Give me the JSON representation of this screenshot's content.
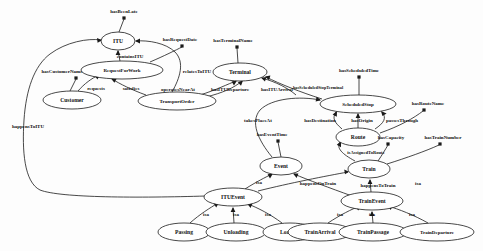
{
  "diagram": {
    "type": "ontology-graph",
    "background_color": "#fdfdfd",
    "stroke_color": "#1a1a1a",
    "text_color": "#101010",
    "entities": [
      {
        "id": "itu",
        "label": "ITU",
        "cx": 118,
        "cy": 41,
        "rx": 17,
        "ry": 9
      },
      {
        "id": "requestforwork",
        "label": "RequestForWork",
        "cx": 122,
        "cy": 70,
        "rx": 41,
        "ry": 9
      },
      {
        "id": "terminal",
        "label": "Terminal",
        "cx": 240,
        "cy": 72,
        "rx": 27,
        "ry": 9
      },
      {
        "id": "customer",
        "label": "Customer",
        "cx": 72,
        "cy": 100,
        "rx": 29,
        "ry": 9
      },
      {
        "id": "transportorder",
        "label": "TransportOrder",
        "cx": 177,
        "cy": 101,
        "rx": 39,
        "ry": 9
      },
      {
        "id": "scheduledstop",
        "label": "ScheduledStop",
        "cx": 358,
        "cy": 104,
        "rx": 38,
        "ry": 9
      },
      {
        "id": "route",
        "label": "Route",
        "cx": 358,
        "cy": 137,
        "rx": 22,
        "ry": 9
      },
      {
        "id": "event",
        "label": "Event",
        "cx": 281,
        "cy": 166,
        "rx": 21,
        "ry": 9
      },
      {
        "id": "train",
        "label": "Train",
        "cx": 369,
        "cy": 169,
        "rx": 21,
        "ry": 9
      },
      {
        "id": "ituevent",
        "label": "ITUEvent",
        "cx": 233,
        "cy": 197,
        "rx": 29,
        "ry": 9
      },
      {
        "id": "trainevent",
        "label": "TrainEvent",
        "cx": 372,
        "cy": 201,
        "rx": 31,
        "ry": 9
      },
      {
        "id": "passing",
        "label": "Passing",
        "cx": 184,
        "cy": 232,
        "rx": 26,
        "ry": 9
      },
      {
        "id": "unloading",
        "label": "Unloading",
        "cx": 236,
        "cy": 232,
        "rx": 30,
        "ry": 9
      },
      {
        "id": "loading",
        "label": "Loading",
        "cx": 290,
        "cy": 232,
        "rx": 27,
        "ry": 9
      },
      {
        "id": "trainarrival",
        "label": "TrainArrival",
        "cx": 320,
        "cy": 232,
        "rx": 32,
        "ry": 9
      },
      {
        "id": "trainpassage",
        "label": "TrainPassage",
        "cx": 373,
        "cy": 232,
        "rx": 34,
        "ry": 9
      },
      {
        "id": "traindeparture",
        "label": "TrainDeparture",
        "cx": 437,
        "cy": 232,
        "rx": 37,
        "ry": 9
      }
    ],
    "relations": [
      {
        "id": "rel-hasbeenlate",
        "label": "hasBeenLate",
        "lx": 124,
        "ly": 11
      },
      {
        "id": "rel-hasrequestdate",
        "label": "hasRequestDate",
        "lx": 180,
        "ly": 39
      },
      {
        "id": "rel-hasterminalname",
        "label": "hasTerminalName",
        "lx": 233,
        "ly": 40
      },
      {
        "id": "rel-containsitu",
        "label": "containsITU",
        "lx": 130,
        "ly": 56
      },
      {
        "id": "rel-relatestoitu",
        "label": "relatesToITU",
        "lx": 197,
        "ly": 71
      },
      {
        "id": "rel-hascustomername",
        "label": "hasCustomerName",
        "lx": 62,
        "ly": 71
      },
      {
        "id": "rel-hasscheduledtime",
        "label": "hasScheduledTime",
        "lx": 359,
        "ly": 70
      },
      {
        "id": "rel-hasscheduledstopterminal",
        "label": "hasScheduledStopTerminal",
        "lx": 318,
        "ly": 87
      },
      {
        "id": "rel-requests",
        "label": "requests",
        "lx": 96,
        "ly": 88
      },
      {
        "id": "rel-satisfies",
        "label": "satisfies",
        "lx": 131,
        "ly": 88
      },
      {
        "id": "rel-operatesnearat",
        "label": "operatesNearAt",
        "lx": 178,
        "ly": 89
      },
      {
        "id": "rel-hasitudeparture",
        "label": "hasITUDeparture",
        "lx": 230,
        "ly": 89
      },
      {
        "id": "rel-hasituarrival",
        "label": "hasITUArrival",
        "lx": 277,
        "ly": 89
      },
      {
        "id": "rel-hasroutename",
        "label": "hasRouteName",
        "lx": 428,
        "ly": 103
      },
      {
        "id": "rel-takesplaceat",
        "label": "takesPlaceAt",
        "lx": 258,
        "ly": 120
      },
      {
        "id": "rel-hasdestination",
        "label": "hasDestination",
        "lx": 320,
        "ly": 120
      },
      {
        "id": "rel-hasorigin",
        "label": "hasOrigin",
        "lx": 362,
        "ly": 120
      },
      {
        "id": "rel-passesthrough",
        "label": "passesThrough",
        "lx": 402,
        "ly": 120
      },
      {
        "id": "rel-haseventtime",
        "label": "hasEventTime",
        "lx": 272,
        "ly": 134
      },
      {
        "id": "rel-hascapacity",
        "label": "hasCapacity",
        "lx": 391,
        "ly": 137
      },
      {
        "id": "rel-hastrainnumber",
        "label": "hasTrainNumber",
        "lx": 443,
        "ly": 137
      },
      {
        "id": "rel-isassignedtoroute",
        "label": "isAssignedToRoute",
        "lx": 366,
        "ly": 152
      },
      {
        "id": "rel-happenstoitu",
        "label": "happensToITU",
        "lx": 28,
        "ly": 126
      },
      {
        "id": "rel-isa-event-ituevent",
        "label": "isa",
        "lx": 259,
        "ly": 182
      },
      {
        "id": "rel-happensontrain",
        "label": "happensOnTrain",
        "lx": 318,
        "ly": 183
      },
      {
        "id": "rel-isa-train-trainevent",
        "label": "isa",
        "lx": 418,
        "ly": 183
      },
      {
        "id": "rel-happenstotrain",
        "label": "happensToTrain",
        "lx": 378,
        "ly": 185
      },
      {
        "id": "rel-isa-passing",
        "label": "isa",
        "lx": 206,
        "ly": 214
      },
      {
        "id": "rel-isa-unloading",
        "label": "isa",
        "lx": 236,
        "ly": 214
      },
      {
        "id": "rel-isa-loading",
        "label": "isa",
        "lx": 268,
        "ly": 214
      },
      {
        "id": "rel-isa-trainarrival",
        "label": "isa",
        "lx": 340,
        "ly": 214
      },
      {
        "id": "rel-isa-trainpassage",
        "label": "isa",
        "lx": 372,
        "ly": 214
      },
      {
        "id": "rel-isa-traindeparture",
        "label": "isa",
        "lx": 412,
        "ly": 214
      }
    ],
    "attribute_markers": [
      {
        "id": "dot-hasbeenlate",
        "cx": 124,
        "cy": 18
      },
      {
        "id": "dot-hasrequestdate",
        "cx": 182,
        "cy": 46
      },
      {
        "id": "dot-hasterminalname",
        "cx": 237,
        "cy": 47
      },
      {
        "id": "dot-hascustomername",
        "cx": 76,
        "cy": 78
      },
      {
        "id": "dot-hasscheduledtime",
        "cx": 359,
        "cy": 77
      },
      {
        "id": "dot-hasroutename",
        "cx": 424,
        "cy": 110
      },
      {
        "id": "dot-haseventtime",
        "cx": 278,
        "cy": 141
      },
      {
        "id": "dot-hascapacity",
        "cx": 388,
        "cy": 144
      },
      {
        "id": "dot-hastrainnumber",
        "cx": 440,
        "cy": 144
      }
    ]
  }
}
